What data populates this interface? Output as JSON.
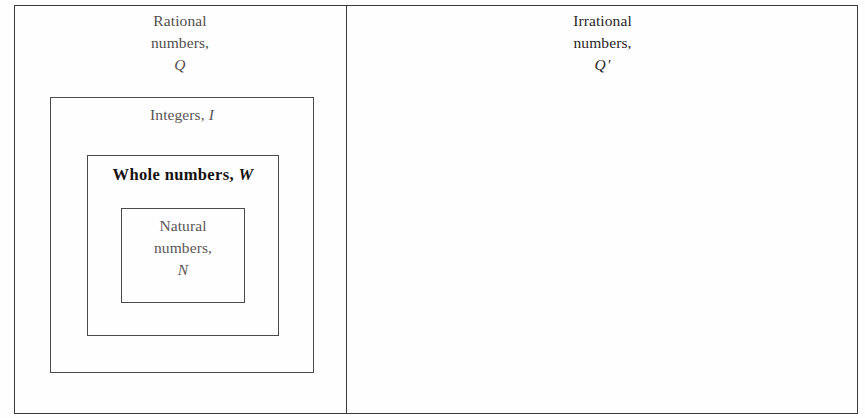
{
  "figure": {
    "type": "nested-set-diagram",
    "background_color": "#fefefe",
    "border_color": "#3a3a3a"
  },
  "sets": {
    "rational": {
      "line1": "Rational",
      "line2": "numbers,",
      "symbol": "Q"
    },
    "irrational": {
      "line1": "Irrational",
      "line2": "numbers,",
      "symbol": "Q",
      "prime": "′"
    },
    "integers": {
      "line1": "Integers,",
      "symbol": "I"
    },
    "whole": {
      "line1": "Whole numbers,",
      "symbol": "W"
    },
    "natural": {
      "line1": "Natural",
      "line2": "numbers,",
      "symbol": "N"
    }
  }
}
